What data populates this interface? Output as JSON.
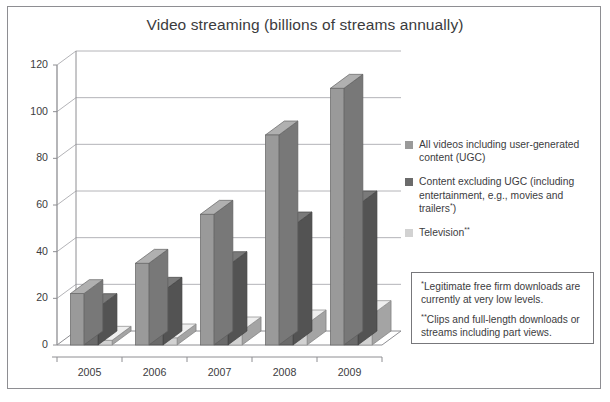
{
  "chart_data": {
    "type": "bar",
    "title": "Video streaming (billions of streams annually)",
    "xlabel": "",
    "ylabel": "",
    "categories": [
      "2005",
      "2006",
      "2007",
      "2008",
      "2009"
    ],
    "ylim": [
      0,
      120
    ],
    "yticks": [
      0,
      20,
      40,
      60,
      80,
      100,
      120
    ],
    "grid": true,
    "legend_position": "right",
    "three_d": true,
    "series": [
      {
        "name": "All videos including user-generated content (UGC)",
        "color": "#9a9a9a",
        "values": [
          22,
          35,
          56,
          90,
          110
        ]
      },
      {
        "name": "Content excluding UGC (including entertainment, e.g., movies and trailers*)",
        "color": "#6b6b6b",
        "values": [
          16,
          23,
          34,
          51,
          60
        ]
      },
      {
        "name": "Television**",
        "color": "#d2d2d2",
        "values": [
          2,
          3,
          6,
          9,
          13
        ]
      }
    ],
    "annotations": [
      "*Legitimate free firm downloads are currently at very low levels.",
      "**Clips and full-length downloads or streams including part views."
    ]
  },
  "legend": {
    "items": [
      {
        "swatch_color": "#9a9a9a",
        "line1": "All videos including user-generated",
        "line2": "content (UGC)",
        "line3": "",
        "marker": ""
      },
      {
        "swatch_color": "#6b6b6b",
        "line1": "Content excluding UGC (including",
        "line2": "entertainment, e.g., movies and",
        "line3": "trailers",
        "marker": "*"
      },
      {
        "swatch_color": "#d2d2d2",
        "line1": "Television",
        "line2": "",
        "line3": "",
        "marker": "**"
      }
    ]
  },
  "footnotes": [
    {
      "mark": "*",
      "text": "Legitimate free firm downloads are currently at very low levels."
    },
    {
      "mark": "**",
      "text": "Clips and full-length downloads or streams including part views."
    }
  ],
  "axis": {
    "y_labels": [
      "120",
      "100",
      "80",
      "60",
      "40",
      "20",
      "0"
    ],
    "x_labels": [
      "2005",
      "2006",
      "2007",
      "2008",
      "2009"
    ]
  },
  "colors": {
    "series1": "#9a9a9a",
    "series2": "#6b6b6b",
    "series3": "#d2d2d2",
    "grid": "#b4b4b8",
    "axis": "#8e8e92",
    "text": "#3c3c3e",
    "frame": "#8e8e92"
  }
}
